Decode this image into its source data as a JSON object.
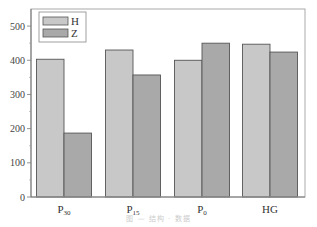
{
  "chart_data": {
    "type": "bar",
    "title": "",
    "xlabel": "",
    "ylabel": "",
    "categories": [
      "P30",
      "P15",
      "P0",
      "HG"
    ],
    "category_display": [
      {
        "main": "P",
        "sub": "30"
      },
      {
        "main": "P",
        "sub": "15"
      },
      {
        "main": "P",
        "sub": "0"
      },
      {
        "main": "HG",
        "sub": ""
      }
    ],
    "series": [
      {
        "name": "H",
        "color": "#c8c8c8",
        "values": [
          403,
          430,
          400,
          447
        ]
      },
      {
        "name": "Z",
        "color": "#a9a9a9",
        "values": [
          187,
          357,
          450,
          424
        ]
      }
    ],
    "ylim": [
      0,
      550
    ],
    "yticks": [
      0,
      100,
      200,
      300,
      400,
      500
    ],
    "grid": false,
    "legend_position": "upper-left",
    "bar_edge_color": "#555555",
    "axis_color": "#888888"
  },
  "caption": "图 — 结构 · 数据"
}
